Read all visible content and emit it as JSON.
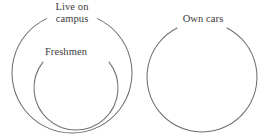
{
  "diagram": {
    "background_color": "#ffffff",
    "stroke_color": "#6e6e6e",
    "text_color": "#3a3a3a",
    "sets": [
      {
        "id": "live-on-campus",
        "label": "Live on campus",
        "label_lines": [
          "Live on",
          "campus"
        ],
        "relation": "outer set containing Freshmen",
        "center_x": 72,
        "center_y": 73,
        "radius": 60
      },
      {
        "id": "freshmen",
        "label": "Freshmen",
        "label_lines": [
          "Freshmen"
        ],
        "relation": "subset of Live on campus",
        "center_x": 76,
        "center_y": 88,
        "radius": 42
      },
      {
        "id": "own-cars",
        "label": "Own cars",
        "label_lines": [
          "Own cars"
        ],
        "relation": "disjoint from Live on campus and Freshmen",
        "center_x": 202,
        "center_y": 77,
        "radius": 55
      }
    ]
  },
  "chart_data": {
    "type": "diagram",
    "subtype": "euler-venn",
    "title": "",
    "sets": [
      "Live on campus",
      "Freshmen",
      "Own cars"
    ],
    "relations": [
      {
        "subset": "Freshmen",
        "superset": "Live on campus"
      },
      {
        "disjoint": [
          "Live on campus",
          "Own cars"
        ]
      },
      {
        "disjoint": [
          "Freshmen",
          "Own cars"
        ]
      }
    ],
    "annotations": [
      "Live on campus",
      "Freshmen",
      "Own cars"
    ],
    "legend": "none",
    "grid": false
  }
}
